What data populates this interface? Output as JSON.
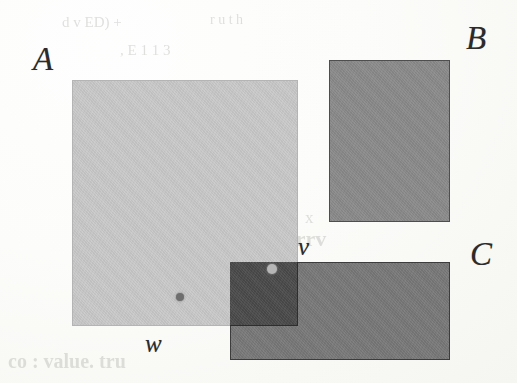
{
  "figure": {
    "type": "geometric-diagram",
    "background_color": "#fbfbf9"
  },
  "rectangles": [
    {
      "id": "A",
      "label": "A",
      "fill_color": "#c9c9c9",
      "border_color": "#b4b4b4",
      "x": 72,
      "y": 80,
      "width": 226,
      "height": 246
    },
    {
      "id": "B",
      "label": "B",
      "fill_color": "#8a8a8a",
      "border_color": "#4e4e4e",
      "x": 329,
      "y": 60,
      "width": 121,
      "height": 162
    },
    {
      "id": "C",
      "label": "C",
      "fill_color": "#787878",
      "border_color": "#3c3c3c",
      "x": 230,
      "y": 262,
      "width": 220,
      "height": 98
    }
  ],
  "overlap": {
    "id": "A-and-C",
    "fill_color": "#4a4a4a",
    "border_color": "#2e2e2e",
    "x": 230,
    "y": 262,
    "width": 68,
    "height": 64
  },
  "points": [
    {
      "id": "w",
      "label": "w",
      "color": "#6e6e6e",
      "x": 180,
      "y": 297,
      "radius": 4,
      "inside": "A"
    },
    {
      "id": "v",
      "label": "v",
      "color": "#b6b6b6",
      "x": 272,
      "y": 269,
      "radius": 5,
      "inside": "A-and-C"
    }
  ],
  "labels": {
    "a": "A",
    "b": "B",
    "c": "C",
    "v": "v",
    "w": "w"
  },
  "background_text": [
    {
      "text": "d  v   ED) +",
      "x": 62,
      "y": 22,
      "size": 15
    },
    {
      "text": "r   u        t  h",
      "x": 210,
      "y": 20,
      "size": 14
    },
    {
      "text": ",  E      1 1 3",
      "x": 120,
      "y": 50,
      "size": 15
    },
    {
      "text": "n o",
      "x": 330,
      "y": 140,
      "size": 16
    },
    {
      "text": "Legend. rrv",
      "x": 215,
      "y": 240,
      "size": 22
    },
    {
      "text": "x",
      "x": 305,
      "y": 218,
      "size": 17
    },
    {
      "text": "co   : value. tru",
      "x": 8,
      "y": 362,
      "size": 20
    }
  ]
}
